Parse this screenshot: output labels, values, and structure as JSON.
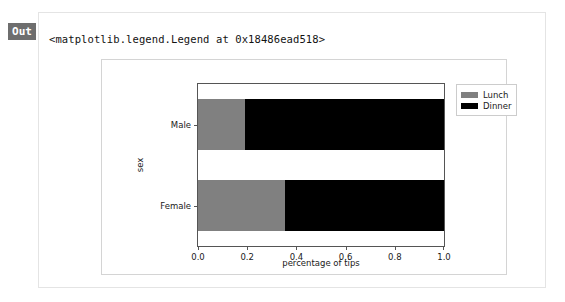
{
  "cell": {
    "prompt_label": "Out",
    "repr_text": "<matplotlib.legend.Legend at 0x18486ead518>"
  },
  "chart_data": {
    "type": "bar",
    "orientation": "horizontal",
    "stacked": true,
    "normalized": true,
    "title": "",
    "xlabel": "percentage of tips",
    "ylabel": "sex",
    "categories": [
      "Male",
      "Female"
    ],
    "xlim": [
      0.0,
      1.0
    ],
    "xticks": [
      0.0,
      0.2,
      0.4,
      0.6,
      0.8,
      1.0
    ],
    "xtick_labels": [
      "0.0",
      "0.2",
      "0.4",
      "0.6",
      "0.8",
      "1.0"
    ],
    "grid": false,
    "legend_position": "upper right (outside)",
    "series": [
      {
        "name": "Lunch",
        "color": "#808080",
        "values": [
          0.19,
          0.355
        ]
      },
      {
        "name": "Dinner",
        "color": "#000000",
        "values": [
          0.81,
          0.645
        ]
      }
    ]
  }
}
